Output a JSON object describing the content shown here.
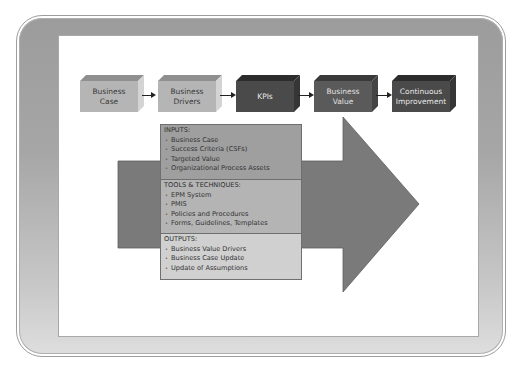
{
  "process_flow": {
    "boxes": [
      {
        "label_line1": "Business",
        "label_line2": "Case",
        "style": "light"
      },
      {
        "label_line1": "Business",
        "label_line2": "Drivers",
        "style": "light"
      },
      {
        "label_line1": "KPIs",
        "label_line2": "",
        "style": "dark"
      },
      {
        "label_line1": "Business",
        "label_line2": "Value",
        "style": "mid"
      },
      {
        "label_line1": "Continuous",
        "label_line2": "Improvement",
        "style": "dark"
      }
    ]
  },
  "process_panel": {
    "inputs": {
      "title": "INPUTS:",
      "items": [
        "Business Case",
        "Success Criteria (CSFs)",
        "Targeted Value",
        "Organizational Process Assets"
      ]
    },
    "tools": {
      "title": "TOOLS & TECHNIQUES:",
      "items": [
        "EPM System",
        "PMIS",
        "Policies and Procedures",
        "Forms, Guidelines, Templates"
      ]
    },
    "outputs": {
      "title": "OUTPUTS:",
      "items": [
        "Business Value Drivers",
        "Business Case Update",
        "Update of Assumptions"
      ]
    }
  },
  "colors": {
    "frame_top": "#9c9c9c",
    "frame_bottom": "#dedede",
    "big_arrow": "#7a7a7a",
    "light_box": "#b5b5b5",
    "dark_box": "#4a4a4a",
    "inputs_bg": "#9f9f9f",
    "tools_bg": "#b4b4b4",
    "outputs_bg": "#d0d0d0"
  }
}
